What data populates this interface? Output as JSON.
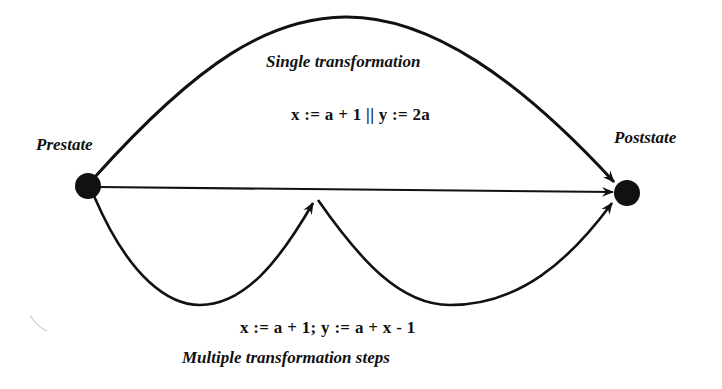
{
  "diagram": {
    "type": "state-transition",
    "nodes": [
      {
        "id": "prestate",
        "label": "Prestate",
        "x": 88,
        "y": 186
      },
      {
        "id": "poststate",
        "label": "Poststate",
        "x": 627,
        "y": 193
      }
    ],
    "intermediate_point": {
      "x": 316,
      "y": 199
    },
    "edges": [
      {
        "id": "single-arc",
        "from": "prestate",
        "to": "poststate",
        "style": "upper-arc"
      },
      {
        "id": "direct-line",
        "from": "prestate",
        "to": "poststate",
        "style": "straight"
      },
      {
        "id": "step-1",
        "from": "prestate",
        "to": "intermediate",
        "style": "lower-left-arc"
      },
      {
        "id": "step-2",
        "from": "intermediate",
        "to": "poststate",
        "style": "lower-right-arc"
      }
    ],
    "labels": {
      "prestate": "Prestate",
      "poststate": "Poststate",
      "single_title": "Single transformation",
      "single_formula": "x := a + 1 || y := 2a",
      "multiple_formula": "x := a + 1;  y := a + x - 1",
      "multiple_title": "Multiple transformation steps"
    },
    "colors": {
      "stroke": "#111111",
      "background": "#ffffff"
    }
  }
}
